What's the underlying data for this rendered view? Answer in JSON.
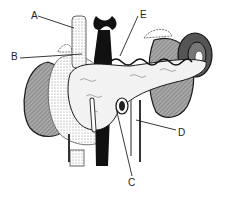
{
  "diagram": {
    "labels": [
      {
        "id": "A",
        "text": "A",
        "x": 31,
        "y": 11
      },
      {
        "id": "B",
        "text": "B",
        "x": 11,
        "y": 52
      },
      {
        "id": "C",
        "text": "C",
        "x": 128,
        "y": 178
      },
      {
        "id": "D",
        "text": "D",
        "x": 178,
        "y": 128
      },
      {
        "id": "E",
        "text": "E",
        "x": 140,
        "y": 10
      }
    ],
    "colors": {
      "outline": "#1a1a1a",
      "shaded": "#8c8c8c",
      "stipple": "#cfcfcf",
      "dark": "#111111",
      "background": "#ffffff"
    }
  }
}
